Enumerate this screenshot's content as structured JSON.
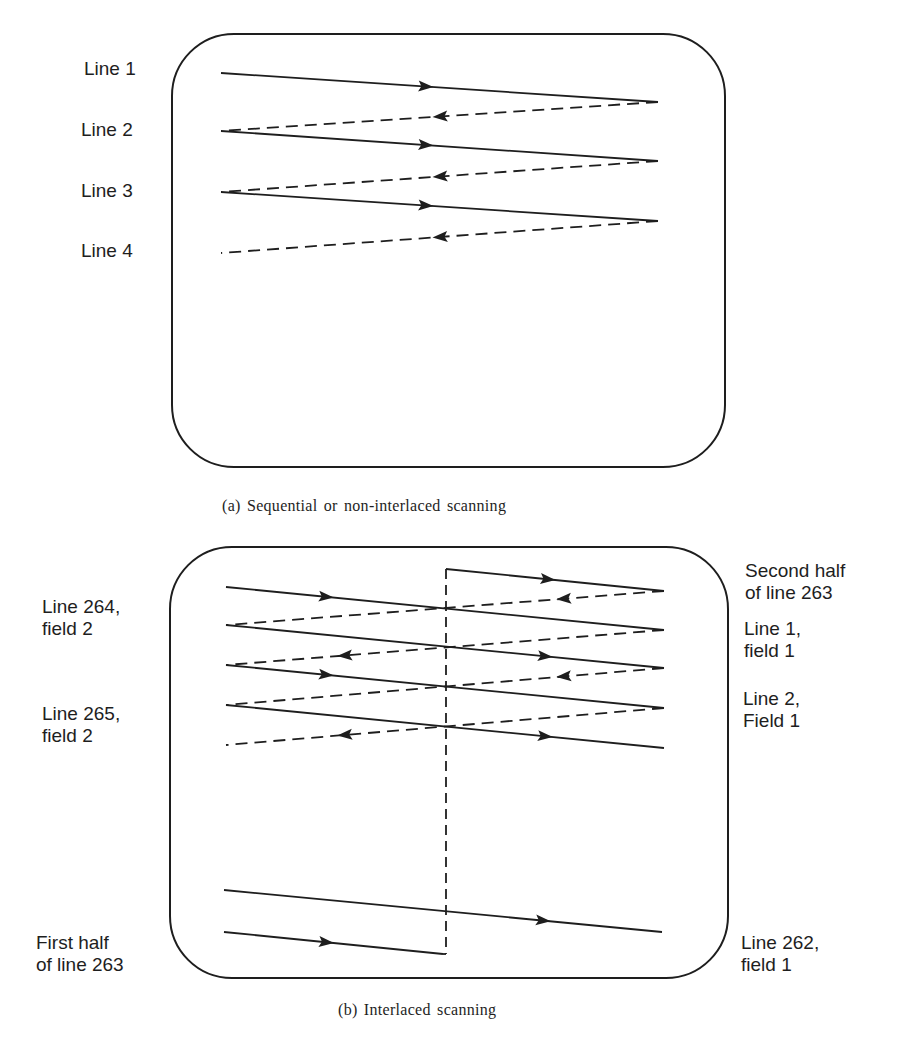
{
  "style": {
    "ink": "#1e1e1e",
    "background": "#ffffff",
    "dash": "12 7"
  },
  "panel_a": {
    "caption": "(a) Sequential or non-interlaced scanning",
    "caption_pos": [
      222,
      497
    ],
    "frame": {
      "x": 172,
      "y": 34,
      "w": 553,
      "h": 433,
      "r": 62
    },
    "labels": [
      {
        "id": "line-1",
        "lines": [
          "Line 1"
        ],
        "pos": [
          84,
          58
        ]
      },
      {
        "id": "line-2",
        "lines": [
          "Line 2"
        ],
        "pos": [
          81,
          119
        ]
      },
      {
        "id": "line-3",
        "lines": [
          "Line 3"
        ],
        "pos": [
          81,
          180
        ]
      },
      {
        "id": "line-4",
        "lines": [
          "Line 4"
        ],
        "pos": [
          81,
          240
        ]
      }
    ],
    "traces": [
      {
        "kind": "solid",
        "from": [
          221,
          73
        ],
        "to": [
          658,
          102
        ],
        "arrow_at": 0.47,
        "dir": "right"
      },
      {
        "kind": "dashed",
        "from": [
          658,
          102
        ],
        "to": [
          221,
          131
        ],
        "arrow_at": 0.5,
        "dir": "left"
      },
      {
        "kind": "solid",
        "from": [
          221,
          131
        ],
        "to": [
          658,
          161
        ],
        "arrow_at": 0.47,
        "dir": "right"
      },
      {
        "kind": "dashed",
        "from": [
          658,
          161
        ],
        "to": [
          221,
          192
        ],
        "arrow_at": 0.5,
        "dir": "left"
      },
      {
        "kind": "solid",
        "from": [
          221,
          192
        ],
        "to": [
          658,
          221
        ],
        "arrow_at": 0.47,
        "dir": "right"
      },
      {
        "kind": "dashed",
        "from": [
          658,
          221
        ],
        "to": [
          221,
          253
        ],
        "arrow_at": 0.5,
        "dir": "left"
      }
    ]
  },
  "panel_b": {
    "caption": "(b) Interlaced scanning",
    "caption_pos": [
      338,
      1001
    ],
    "frame": {
      "x": 170,
      "y": 547,
      "w": 558,
      "h": 431,
      "r": 62
    },
    "labels_left": [
      {
        "id": "line-264-field-2",
        "lines": [
          "Line 264,",
          "field 2"
        ],
        "pos": [
          42,
          596
        ]
      },
      {
        "id": "line-265-field-2",
        "lines": [
          "Line 265,",
          "field 2"
        ],
        "pos": [
          42,
          703
        ]
      },
      {
        "id": "first-half-line-263",
        "lines": [
          "First half",
          "of line 263"
        ],
        "pos": [
          36,
          932
        ]
      }
    ],
    "labels_right": [
      {
        "id": "second-half-line-263",
        "lines": [
          "Second half",
          "of line 263"
        ],
        "pos": [
          745,
          560
        ]
      },
      {
        "id": "line-1-field-1",
        "lines": [
          "Line 1,",
          "field 1"
        ],
        "pos": [
          744,
          618
        ]
      },
      {
        "id": "line-2-field-1",
        "lines": [
          "Line 2,",
          "Field 1"
        ],
        "pos": [
          743,
          688
        ]
      },
      {
        "id": "line-262-field-1",
        "lines": [
          "Line 262,",
          "field 1"
        ],
        "pos": [
          741,
          932
        ]
      }
    ],
    "vertical_retrace": {
      "x": 446,
      "y1": 569,
      "y2": 954
    },
    "traces": [
      {
        "kind": "solid",
        "from": [
          446,
          569
        ],
        "to": [
          664,
          591
        ],
        "arrow_at": 0.47,
        "dir": "right"
      },
      {
        "kind": "solid",
        "from": [
          226,
          587
        ],
        "to": [
          664,
          630
        ],
        "arrow_at": 0.23,
        "dir": "right"
      },
      {
        "kind": "dashed",
        "from": [
          664,
          591
        ],
        "to": [
          226,
          625
        ],
        "arrow_at": 0.23,
        "dir": "left"
      },
      {
        "kind": "solid",
        "from": [
          226,
          625
        ],
        "to": [
          664,
          668
        ],
        "arrow_at": 0.73,
        "dir": "right"
      },
      {
        "kind": "dashed",
        "from": [
          664,
          630
        ],
        "to": [
          226,
          665
        ],
        "arrow_at": 0.73,
        "dir": "left"
      },
      {
        "kind": "solid",
        "from": [
          226,
          665
        ],
        "to": [
          664,
          708
        ],
        "arrow_at": 0.23,
        "dir": "right"
      },
      {
        "kind": "dashed",
        "from": [
          664,
          668
        ],
        "to": [
          226,
          705
        ],
        "arrow_at": 0.23,
        "dir": "left"
      },
      {
        "kind": "solid",
        "from": [
          226,
          705
        ],
        "to": [
          664,
          748
        ],
        "arrow_at": 0.73,
        "dir": "right"
      },
      {
        "kind": "dashed",
        "from": [
          664,
          708
        ],
        "to": [
          226,
          745
        ],
        "arrow_at": 0.73,
        "dir": "left"
      },
      {
        "kind": "solid",
        "from": [
          224,
          890
        ],
        "to": [
          662,
          932
        ],
        "arrow_at": 0.73,
        "dir": "right"
      },
      {
        "kind": "solid",
        "from": [
          224,
          932
        ],
        "to": [
          443,
          954
        ],
        "arrow_at": 0.47,
        "dir": "right"
      }
    ],
    "corner_tick": {
      "from": [
        443,
        954
      ],
      "to": [
        446,
        954
      ]
    }
  }
}
